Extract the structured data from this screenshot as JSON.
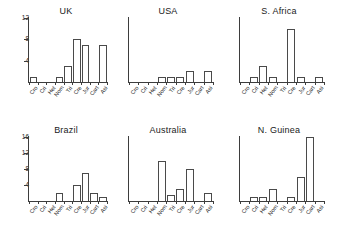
{
  "figure": {
    "background": "#ffffff",
    "bar_edge_color": "#4a4a4a",
    "bar_fill_color": "#ffffff",
    "axis_color": "#3d3d3d"
  },
  "chart_data": {
    "type": "bar",
    "title": "",
    "xlabel": "",
    "ylabel": "",
    "grid": false,
    "legend": null,
    "layout": {
      "rows": 2,
      "cols": 3,
      "shared_x": true,
      "shared_y_per_row": true
    },
    "categories": [
      "Cro",
      "Cri",
      "Het",
      "Nom",
      "Tri",
      "Cre",
      "Jur",
      "Cart",
      "Asi"
    ],
    "panels": [
      {
        "title": "UK",
        "row": 0,
        "col": 0,
        "ylim": [
          0,
          12
        ],
        "yticks": [
          4,
          8,
          12
        ],
        "values": [
          1,
          0,
          0,
          1,
          3,
          8,
          7,
          0,
          7
        ]
      },
      {
        "title": "USA",
        "row": 0,
        "col": 1,
        "ylim": [
          0,
          12
        ],
        "yticks": [
          4,
          8,
          12
        ],
        "values": [
          0,
          0,
          0,
          1,
          1,
          1,
          2,
          0,
          2
        ]
      },
      {
        "title": "S. Africa",
        "row": 0,
        "col": 2,
        "ylim": [
          0,
          12
        ],
        "yticks": [
          4,
          8,
          12
        ],
        "values": [
          0,
          1,
          3,
          1,
          0,
          10,
          1,
          0,
          1
        ]
      },
      {
        "title": "Brazil",
        "row": 1,
        "col": 0,
        "ylim": [
          0,
          16
        ],
        "yticks": [
          4,
          8,
          12,
          16
        ],
        "values": [
          0,
          0,
          0,
          2,
          0,
          4,
          7,
          2,
          1
        ]
      },
      {
        "title": "Australia",
        "row": 1,
        "col": 1,
        "ylim": [
          0,
          16
        ],
        "yticks": [
          4,
          8,
          12,
          16
        ],
        "values": [
          0,
          0,
          0,
          10,
          1.5,
          3,
          8,
          0,
          2
        ]
      },
      {
        "title": "N. Guinea",
        "row": 1,
        "col": 2,
        "ylim": [
          0,
          16
        ],
        "yticks": [
          4,
          8,
          12,
          16
        ],
        "values": [
          0,
          1,
          1,
          3,
          0,
          1,
          6,
          16,
          0
        ]
      }
    ]
  }
}
